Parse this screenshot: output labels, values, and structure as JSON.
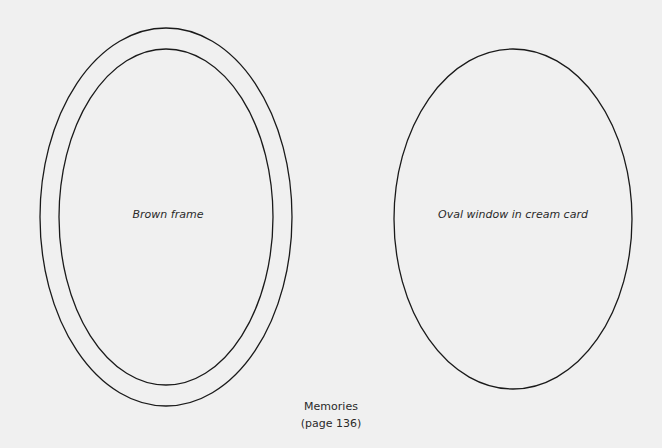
{
  "template": {
    "caption": {
      "title": "Memories",
      "page": "(page 136)"
    },
    "shapes": {
      "frame": {
        "label": "Brown frame",
        "outer": {
          "cx": 166,
          "cy": 217,
          "rx": 126,
          "ry": 189
        },
        "inner": {
          "cx": 166,
          "cy": 217,
          "rx": 107,
          "ry": 168
        }
      },
      "window": {
        "label": "Oval window in cream card",
        "oval": {
          "cx": 513,
          "cy": 219,
          "rx": 119,
          "ry": 170
        }
      }
    },
    "colors": {
      "background": "#f0f0f0",
      "stroke": "#1a1a1a",
      "text": "#2a2a2a"
    }
  }
}
